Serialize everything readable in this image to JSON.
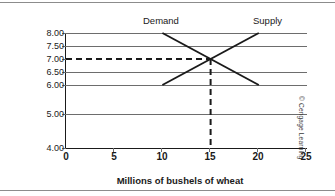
{
  "chart_data": {
    "type": "line",
    "title": "",
    "xlabel": "Millions of bushels of wheat",
    "ylabel_lines": [
      "Price per bushel of",
      "wheat (in dollars)"
    ],
    "xlim": [
      0,
      25
    ],
    "ylim": [
      4.0,
      8.0
    ],
    "grid": true,
    "legend_position": "inline-above-curves",
    "xticks": [
      "0",
      "5",
      "10",
      "15",
      "20",
      "25"
    ],
    "xtick_values": [
      0,
      5,
      10,
      15,
      20,
      25
    ],
    "yticks": [
      "8.00",
      "7.50",
      "7.00",
      "6.50",
      "6.00",
      "5.00",
      "4.00"
    ],
    "ytick_values": [
      8.0,
      7.5,
      7.0,
      6.5,
      6.0,
      5.0,
      4.0
    ],
    "series": [
      {
        "name": "Demand",
        "points": [
          [
            10,
            8.0
          ],
          [
            20,
            6.0
          ]
        ],
        "color": "#1a1a1a"
      },
      {
        "name": "Supply",
        "points": [
          [
            10,
            6.0
          ],
          [
            20,
            8.0
          ]
        ],
        "color": "#1a1a1a"
      }
    ],
    "annotations": [
      {
        "name": "equilibrium",
        "x": 15,
        "y": 7.0,
        "guide_horizontal_from_x": 0,
        "guide_vertical_to_y": 4.0,
        "style": "dashed"
      }
    ]
  },
  "labels": {
    "demand": "Demand",
    "supply": "Supply",
    "x_axis_title": "Millions of bushels of wheat",
    "y_axis_title_line1": "Price per bushel of",
    "y_axis_title_line2": "wheat (in dollars)"
  },
  "ytick_labels": [
    "8.00",
    "7.50",
    "7.00",
    "6.50",
    "6.00",
    "5.00",
    "4.00"
  ],
  "xtick_labels": [
    "0",
    "5",
    "10",
    "15",
    "20",
    "25"
  ],
  "credit": "© Cengage Learning",
  "colors": {
    "curve": "#1a1a1a",
    "gridline": "#6d6d6d",
    "axis": "#1a1a1a",
    "rule": "#8c8c8c",
    "text": "#1a1a1a",
    "background": "#ffffff"
  }
}
